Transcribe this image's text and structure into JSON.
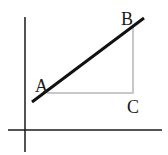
{
  "diagram": {
    "type": "right-triangle-slope",
    "axes": {
      "color": "#1a1a1a",
      "vertical": {
        "x": 25,
        "y1": 17,
        "y2": 152
      },
      "horizontal": {
        "y": 130,
        "x1": 8,
        "x2": 162
      }
    },
    "line": {
      "color": "#111111",
      "x1": 32,
      "y1": 102,
      "x2": 144,
      "y2": 18,
      "width": 3
    },
    "triangle": {
      "color": "#c8c8c8",
      "legs": {
        "A": [
          47,
          93
        ],
        "C": [
          133,
          93
        ],
        "B": [
          133,
          25
        ]
      }
    },
    "points": [
      {
        "label": "A",
        "x": 35,
        "y": 92
      },
      {
        "label": "B",
        "x": 121,
        "y": 25
      },
      {
        "label": "C",
        "x": 127,
        "y": 113
      }
    ]
  }
}
